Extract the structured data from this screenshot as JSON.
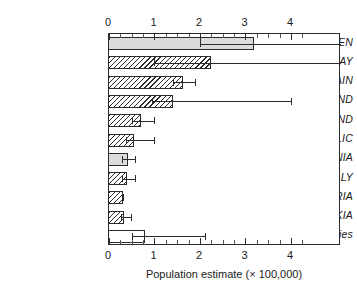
{
  "chart_data": {
    "type": "bar",
    "orientation": "horizontal",
    "title": "",
    "xlabel": "Population estimate (× 100,000)",
    "ylabel": "",
    "xlim": [
      0,
      5.1
    ],
    "xticks": [
      0,
      1,
      2,
      3,
      4
    ],
    "xtick_labels": [
      "0",
      "1",
      "2",
      "3",
      "4"
    ],
    "xminor_step": 0.25,
    "grid": false,
    "legend": false,
    "axis_top": true,
    "axis_bottom": true,
    "categories": [
      "SWEDEN",
      "NORWAY",
      "SPAIN",
      "FINLAND",
      "SWITZERLAND",
      "CZECH REPUBLIC",
      "ROMANIA",
      "ITALY",
      "AUSTRIA",
      "SLOVAKIA",
      "Other countries"
    ],
    "values": [
      3.19,
      2.24,
      1.63,
      1.41,
      0.7,
      0.55,
      0.41,
      0.4,
      0.31,
      0.34,
      0.79
    ],
    "error_low": [
      2.0,
      1.0,
      1.4,
      0.95,
      0.5,
      0.38,
      0.28,
      0.28,
      0.31,
      0.26,
      0.5
    ],
    "error_high": [
      5.1,
      5.1,
      1.9,
      4.0,
      1.0,
      1.0,
      0.58,
      0.57,
      0.31,
      0.48,
      2.1
    ],
    "fills": [
      "solid",
      "hatch",
      "hatch",
      "hatch",
      "hatch",
      "hatch",
      "solid",
      "hatch",
      "hatch",
      "hatch",
      "open"
    ],
    "colors": {
      "solid_fill": "#dcdcdc",
      "open_fill": "#ffffff",
      "hatch_line": "#2b2b2b",
      "axis": "#2b2b2b",
      "text": "#1a1a1a",
      "background": "#ffffff"
    }
  }
}
